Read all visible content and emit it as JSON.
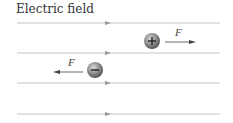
{
  "title": "Electric field",
  "field_lines": [
    {
      "y": 23
    },
    {
      "y": 53
    },
    {
      "y": 83
    },
    {
      "y": 114
    }
  ],
  "charges": [
    {
      "sign": "+",
      "x": 152,
      "y": 41,
      "force_label": "F",
      "force_direction": "right"
    },
    {
      "sign": "−",
      "x": 95,
      "y": 70,
      "force_label": "F",
      "force_direction": "left"
    }
  ],
  "colors": {
    "line": "#b5b5b5",
    "charge": "#8a8a8a",
    "text": "#333333"
  }
}
